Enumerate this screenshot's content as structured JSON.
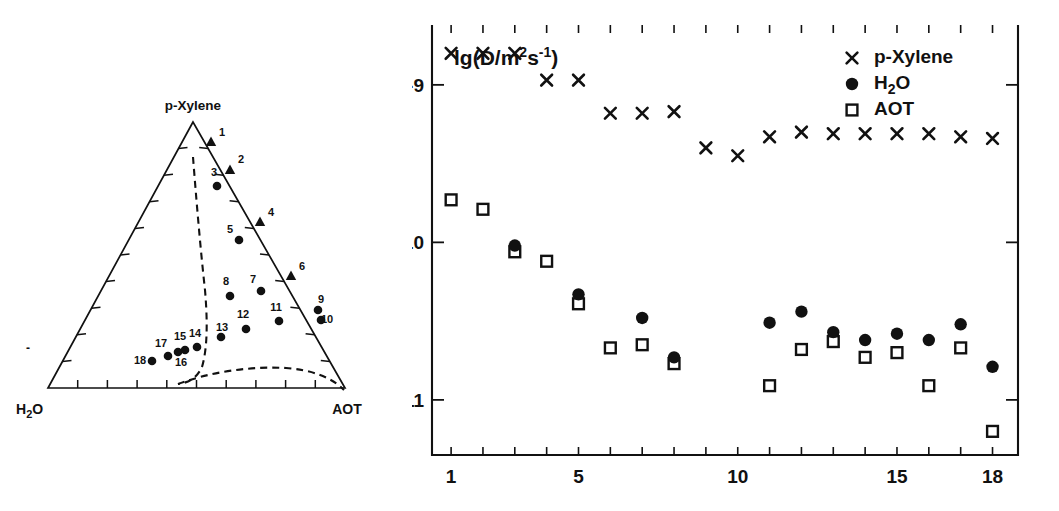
{
  "figure": {
    "panels": [
      "ternary-phase-diagram",
      "diffusion-coefficient-plot"
    ]
  },
  "ternary": {
    "type": "ternary",
    "vertex_top_label": "p-Xylene",
    "vertex_left_label": "H₂O",
    "vertex_right_label": "AOT",
    "tick_count_per_side": 10,
    "phase_boundary_note": "dashed curves delimit one-phase microemulsion region",
    "points": [
      {
        "id": "1",
        "marker": "triangle",
        "px": 211,
        "py": 142,
        "lx": 222,
        "ly": 136
      },
      {
        "id": "2",
        "marker": "triangle",
        "px": 230,
        "py": 170,
        "lx": 241,
        "ly": 163
      },
      {
        "id": "3",
        "marker": "circle",
        "px": 217,
        "py": 186,
        "lx": 214,
        "ly": 176
      },
      {
        "id": "4",
        "marker": "triangle",
        "px": 260,
        "py": 222,
        "lx": 271,
        "ly": 216
      },
      {
        "id": "5",
        "marker": "circle",
        "px": 239,
        "py": 240,
        "lx": 230,
        "ly": 233
      },
      {
        "id": "6",
        "marker": "triangle",
        "px": 291,
        "py": 276,
        "lx": 302,
        "ly": 270
      },
      {
        "id": "7",
        "marker": "circle",
        "px": 261,
        "py": 291,
        "lx": 253,
        "ly": 283
      },
      {
        "id": "8",
        "marker": "circle",
        "px": 230,
        "py": 296,
        "lx": 226,
        "ly": 285
      },
      {
        "id": "9",
        "marker": "circle",
        "px": 318,
        "py": 310,
        "lx": 321,
        "ly": 303
      },
      {
        "id": "10",
        "marker": "circle",
        "px": 321,
        "py": 320,
        "lx": 327,
        "ly": 323
      },
      {
        "id": "11",
        "marker": "circle",
        "px": 279,
        "py": 321,
        "lx": 276,
        "ly": 311
      },
      {
        "id": "12",
        "marker": "circle",
        "px": 246,
        "py": 329,
        "lx": 243,
        "ly": 318
      },
      {
        "id": "13",
        "marker": "circle",
        "px": 221,
        "py": 337,
        "lx": 222,
        "ly": 331
      },
      {
        "id": "14",
        "marker": "circle",
        "px": 197,
        "py": 347,
        "lx": 195,
        "ly": 337
      },
      {
        "id": "15",
        "marker": "circle",
        "px": 185,
        "py": 350,
        "lx": 180,
        "ly": 340
      },
      {
        "id": "16",
        "marker": "circle",
        "px": 178,
        "py": 352,
        "lx": 181,
        "ly": 366
      },
      {
        "id": "17",
        "marker": "circle",
        "px": 168,
        "py": 356,
        "lx": 161,
        "ly": 347
      },
      {
        "id": "18",
        "marker": "circle",
        "px": 152,
        "py": 361,
        "lx": 140,
        "ly": 364
      }
    ],
    "boundary_left": "M 193 122 C 196 160 200 210 205 255 C 208 290 207 315 202 332 C 196 345 186 348 178 349",
    "boundary_bottom": "M 178 349 C 210 337 250 331 286 333 C 312 335 331 342 344 355"
  },
  "chart_data": {
    "type": "scatter",
    "title": "",
    "ylabel": "lg(D/m²s⁻¹)",
    "xlabel": "",
    "x": [
      1,
      2,
      3,
      4,
      5,
      6,
      7,
      8,
      9,
      10,
      11,
      12,
      13,
      14,
      15,
      16,
      17,
      18
    ],
    "xlim": [
      0.4,
      18.8
    ],
    "ylim": [
      -11.35,
      -8.62
    ],
    "xticks": [
      1,
      2,
      3,
      4,
      5,
      6,
      7,
      8,
      9,
      10,
      11,
      12,
      13,
      14,
      15,
      16,
      17,
      18
    ],
    "xticklabels": [
      {
        "v": 1,
        "text": "1"
      },
      {
        "v": 5,
        "text": "5"
      },
      {
        "v": 10,
        "text": "10"
      },
      {
        "v": 15,
        "text": "15"
      },
      {
        "v": 18,
        "text": "18"
      }
    ],
    "yticks": [
      -9,
      -10,
      -11
    ],
    "yticklabels": [
      "-9",
      "-10",
      "-11"
    ],
    "grid": false,
    "legend_position": "top-right",
    "series": [
      {
        "name": "p-Xylene",
        "marker": "x",
        "legend_label": "p-Xylene",
        "values": [
          -8.8,
          -8.8,
          -8.8,
          -8.97,
          -8.97,
          -9.18,
          -9.18,
          -9.17,
          -9.4,
          -9.45,
          -9.33,
          -9.3,
          -9.31,
          -9.31,
          -9.31,
          -9.31,
          -9.33,
          -9.34
        ]
      },
      {
        "name": "H2O",
        "marker": "filled-circle",
        "legend_label": "H₂O",
        "values": [
          null,
          null,
          -10.02,
          null,
          -10.33,
          null,
          -10.48,
          -10.73,
          null,
          null,
          -10.51,
          -10.44,
          -10.57,
          -10.62,
          -10.58,
          -10.62,
          -10.52,
          -10.79
        ]
      },
      {
        "name": "AOT",
        "marker": "open-square",
        "legend_label": "AOT",
        "values": [
          -9.73,
          -9.79,
          -10.06,
          -10.12,
          -10.39,
          -10.67,
          -10.65,
          -10.77,
          null,
          null,
          -10.91,
          -10.68,
          -10.63,
          -10.73,
          -10.7,
          -10.91,
          -10.67,
          -11.2
        ]
      }
    ]
  }
}
